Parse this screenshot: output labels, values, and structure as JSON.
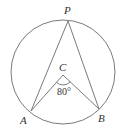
{
  "diagram": {
    "type": "circle-geometry",
    "colors": {
      "stroke": "#7a7a7a",
      "text": "#333333",
      "background": "#ffffff"
    },
    "circle": {
      "cx": 63,
      "cy": 72,
      "r": 52
    },
    "points": {
      "P": {
        "label": "P",
        "x": 68,
        "y": 21
      },
      "A": {
        "label": "A",
        "x": 31,
        "y": 111
      },
      "B": {
        "label": "B",
        "x": 99,
        "y": 109
      },
      "C": {
        "label": "C",
        "x": 63,
        "y": 75
      }
    },
    "segments": [
      "PA",
      "PB",
      "CA",
      "CB"
    ],
    "angle_marker": {
      "vertex": "C",
      "label": "80°"
    }
  }
}
